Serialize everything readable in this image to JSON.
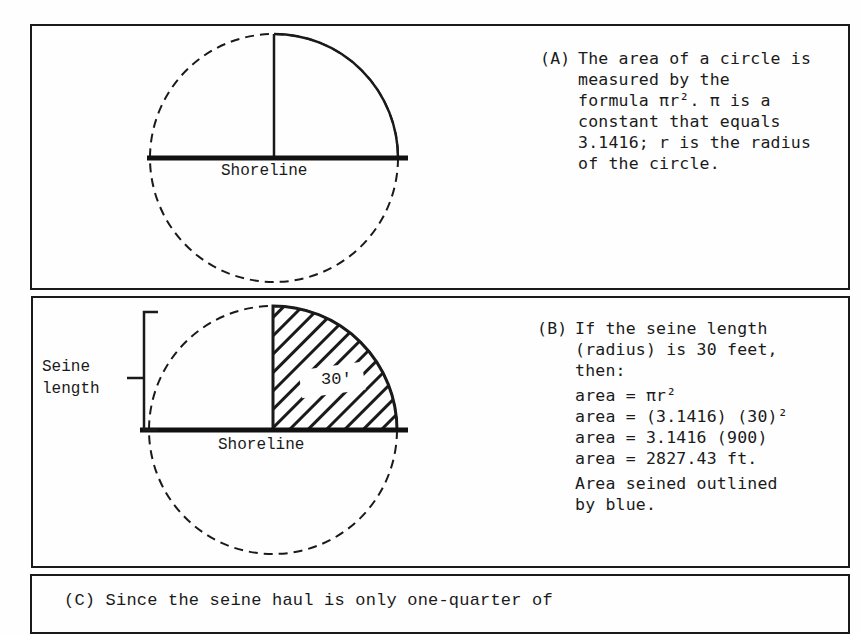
{
  "panel_a": {
    "tag": "(A)",
    "lines": [
      "The area of a circle is",
      "measured by the",
      "formula πr². π is a",
      "constant that equals",
      "3.1416; r is the radius",
      "of the circle."
    ],
    "shoreline_label": "Shoreline"
  },
  "panel_b": {
    "tag": "(B)",
    "intro_lines": [
      "If the seine length",
      "(radius) is 30 feet,",
      "then:"
    ],
    "equations": [
      "area = πr²",
      "area = (3.1416) (30)²",
      "area = 3.1416 (900)",
      "area = 2827.43 ft."
    ],
    "note_lines": [
      "Area seined outlined",
      "by blue."
    ],
    "shoreline_label": "Shoreline",
    "radius_label": "30′",
    "bracket_label_lines": [
      "Seine",
      "length"
    ]
  },
  "panel_c": {
    "text": "(C) Since the seine haul is only one-quarter of"
  },
  "colors": {
    "ink": "#1a1a1a",
    "paper": "#fefefe"
  }
}
